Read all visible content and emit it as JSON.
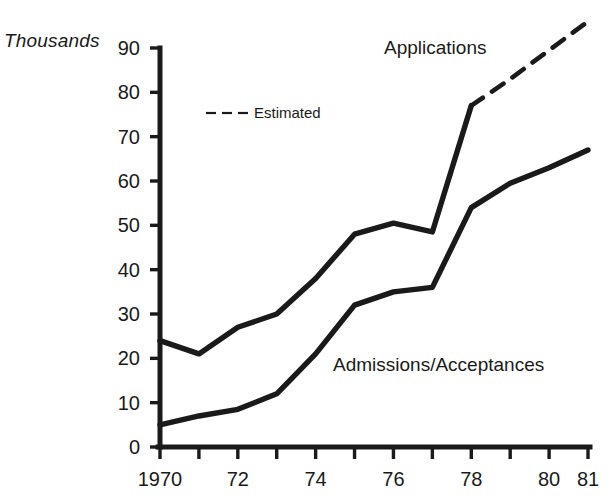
{
  "chart_data": {
    "type": "line",
    "title": "",
    "subtitle": "",
    "xlabel": "",
    "ylabel": "Thousands",
    "unit_label": "Thousands",
    "x": [
      1970,
      1971,
      1972,
      1973,
      1974,
      1975,
      1976,
      1977,
      1978,
      1979,
      1980,
      1981
    ],
    "xtick_labels": [
      "1970",
      "",
      "72",
      "",
      "74",
      "",
      "76",
      "",
      "78",
      "",
      "80",
      "81"
    ],
    "xtick_labels_shown": [
      "1970",
      "72",
      "74",
      "76",
      "78",
      "80",
      "81"
    ],
    "ytick_labels": [
      "0",
      "10",
      "20",
      "30",
      "40",
      "50",
      "60",
      "70",
      "80",
      "90"
    ],
    "yticks": [
      0,
      10,
      20,
      30,
      40,
      50,
      60,
      70,
      80,
      90
    ],
    "ylim": [
      0,
      90
    ],
    "xlim": [
      1970,
      1981
    ],
    "grid": false,
    "legend_position": "inline-upper-left",
    "series": [
      {
        "name": "Applications",
        "label": "Applications",
        "color": "#1a1a1a",
        "style": "solid",
        "values": [
          24,
          21,
          27,
          30,
          38,
          48,
          50.5,
          48.5,
          77,
          null,
          null,
          null
        ]
      },
      {
        "name": "Applications (Estimated)",
        "label": "Estimated",
        "color": "#1a1a1a",
        "style": "dashed",
        "values": [
          null,
          null,
          null,
          null,
          null,
          null,
          null,
          null,
          77,
          83,
          89.5,
          96
        ]
      },
      {
        "name": "Admissions/Acceptances",
        "label": "Admissions/Acceptances",
        "color": "#1a1a1a",
        "style": "solid",
        "values": [
          5,
          7,
          8.5,
          12,
          21,
          32,
          35,
          36,
          54,
          59.5,
          63,
          67
        ]
      }
    ],
    "annotations": [
      {
        "text": "Applications",
        "x": 1980.2,
        "y": 89
      },
      {
        "text": "Admissions/Acceptances",
        "x": 1974.5,
        "y": 18
      },
      {
        "text": "Estimated",
        "x": 1972.9,
        "y": 75
      }
    ]
  },
  "legend": {
    "estimated_label": "Estimated"
  },
  "labels": {
    "applications": "Applications",
    "admissions": "Admissions/Acceptances",
    "thousands": "Thousands"
  }
}
